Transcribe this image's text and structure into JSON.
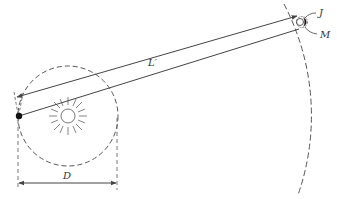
{
  "diagram": {
    "labels": {
      "distance": "L′",
      "jupiter": "J",
      "moon": "M",
      "diameter": "D"
    },
    "elements": {
      "sun": "sun-icon",
      "earth": "earth-dot",
      "earth_orbit": "dashed circle",
      "jupiter_orbit": "dashed arc"
    },
    "colors": {
      "stroke": "#444444",
      "fill": "#111111",
      "background": "#ffffff"
    }
  }
}
